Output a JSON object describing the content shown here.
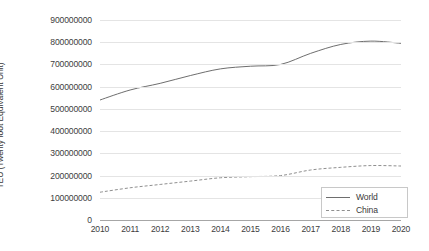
{
  "chart_data": {
    "type": "line",
    "title": "",
    "xlabel": "",
    "ylabel": "TEU (Twenty foot Equivalent Unit)",
    "grid": true,
    "legend_position": "bottom-right",
    "x": [
      2010,
      2011,
      2012,
      2013,
      2014,
      2015,
      2016,
      2017,
      2018,
      2019,
      2020
    ],
    "categories": [
      "2010",
      "2011",
      "2012",
      "2013",
      "2014",
      "2015",
      "2016",
      "2017",
      "2018",
      "2019",
      "2020"
    ],
    "xlim": [
      2010,
      2020
    ],
    "ylim": [
      0,
      900000000
    ],
    "ytick_labels": [
      "900000000",
      "800000000",
      "700000000",
      "600000000",
      "500000000",
      "400000000",
      "300000000",
      "200000000",
      "100000000",
      "0"
    ],
    "ytick_values": [
      900000000,
      800000000,
      700000000,
      600000000,
      500000000,
      400000000,
      300000000,
      200000000,
      100000000,
      0
    ],
    "series": [
      {
        "name": "World",
        "style": "solid",
        "color": "#6e6e6e",
        "values": [
          540000000,
          585000000,
          615000000,
          650000000,
          680000000,
          692000000,
          700000000,
          750000000,
          790000000,
          805000000,
          795000000
        ]
      },
      {
        "name": "China",
        "style": "dashed",
        "color": "#8f8f8f",
        "values": [
          125000000,
          145000000,
          160000000,
          175000000,
          190000000,
          195000000,
          200000000,
          225000000,
          237000000,
          245000000,
          243000000
        ]
      }
    ]
  },
  "legend": {
    "items": [
      {
        "label": "World"
      },
      {
        "label": "China"
      }
    ]
  },
  "colors": {
    "gridline": "#e4e4e4",
    "axis": "#a6a6a6",
    "text": "#404040",
    "background": "#ffffff"
  }
}
